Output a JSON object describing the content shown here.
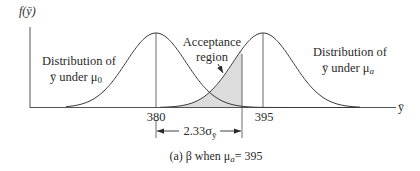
{
  "figure": {
    "y_axis_label": "f(ȳ)",
    "x_axis_label": "ȳ",
    "left_distribution_label": [
      "Distribution of",
      "ȳ under μ",
      "0"
    ],
    "right_distribution_label": [
      "Distribution of",
      "ȳ under μ",
      "a"
    ],
    "acceptance_label": [
      "Acceptance",
      "region"
    ],
    "tick_left": "380",
    "tick_right": "395",
    "distance_label": "2.33σ",
    "distance_sub": "ȳ",
    "caption": "(a) β when μ",
    "caption_sub": "a",
    "caption_tail": "= 395"
  },
  "chart_data": {
    "type": "line",
    "xlabel": "ȳ",
    "ylabel": "f(ȳ)",
    "series": [
      {
        "name": "Distribution of ȳ under μ0",
        "mean": 380
      },
      {
        "name": "Distribution of ȳ under μa",
        "mean": 395
      }
    ],
    "critical_value_offset_sigma": 2.33,
    "shaded_region": "Acceptance region (β) under μa, left of critical value",
    "x_ticks": [
      "380",
      "395"
    ],
    "colors": {
      "line": "#3a3a3a",
      "shade": "#dcdcdc"
    }
  }
}
